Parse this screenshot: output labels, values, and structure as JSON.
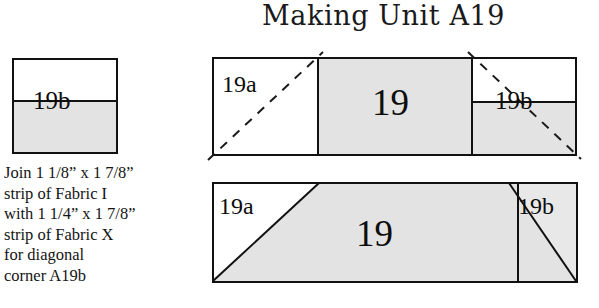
{
  "title": "Making Unit A19",
  "instructions": {
    "lines": [
      "Join 1 1/8” x 1 7/8”",
      "strip of Fabric I",
      "with 1 1/4” x 1 7/8”",
      "strip of Fabric X",
      "for diagonal",
      "corner A19b"
    ]
  },
  "colors": {
    "fabric_gray": "#e3e3e3",
    "fabric_white": "#ffffff",
    "outline": "#111111",
    "dash": "#1a1a1a",
    "page_background": "#ffffff"
  },
  "swatch": {
    "label": "19b",
    "top_fabric": "Fabric I",
    "bottom_fabric": "Fabric X"
  },
  "top_diagram": {
    "left_piece_label": "19a",
    "center_piece_label": "19",
    "right_piece_label": "19b"
  },
  "bottom_diagram": {
    "left_corner_label": "19a",
    "center_label": "19",
    "right_corner_label": "19b"
  }
}
